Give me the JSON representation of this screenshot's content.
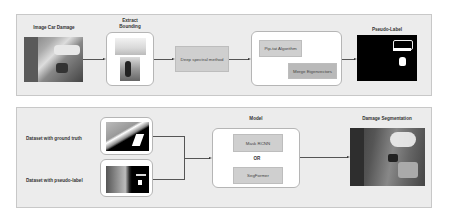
{
  "top_pipeline": {
    "input_title": "Image Car Damage",
    "extract_title": "Extract\nBounding",
    "extract_title_line1": "Extract",
    "extract_title_line2": "Bounding",
    "spectral_label": "Deep spectral method",
    "algorithm_labels": [
      "Pip-tat Algorithm",
      "Merge Eigenvectors"
    ],
    "output_title": "Pseudo-Label"
  },
  "bottom_pipeline": {
    "dataset_labels": [
      "Dataset with ground truth",
      "Dataset with pseudo-label"
    ],
    "model_title": "Model",
    "model_options": [
      "Mask RCNN",
      "SegFormer"
    ],
    "or_label": "OR",
    "output_title": "Damage Segmentation"
  },
  "colors": {
    "panel_bg": "#ececec",
    "box_bg": "#cfcfcf",
    "pseudo_label_bg": "#000000"
  }
}
